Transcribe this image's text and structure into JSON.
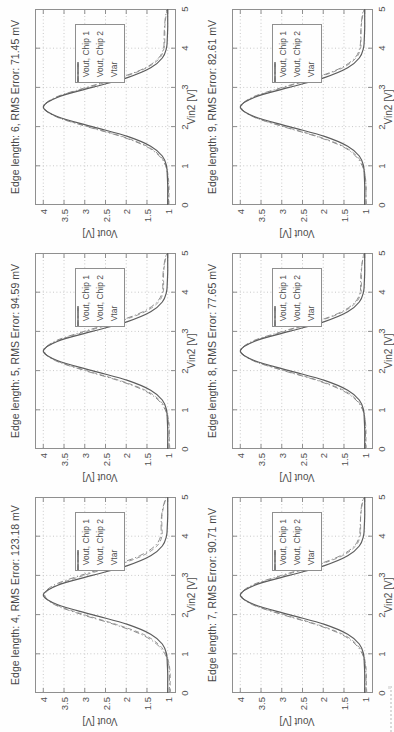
{
  "figure": {
    "xlabel": "Vin2 [V]",
    "ylabel": "Vout [V]",
    "xlim": [
      0,
      5
    ],
    "ylim": [
      0.8,
      4.2
    ],
    "xticks": [
      0,
      1,
      2,
      3,
      4,
      5
    ],
    "yticks": [
      4,
      3.5,
      3,
      2.5,
      2,
      1.5,
      1
    ],
    "xtick_labels": [
      "0",
      "1",
      "2",
      "3",
      "4",
      "5"
    ],
    "ytick_labels": [
      "4",
      "3.5",
      "3",
      "2.5",
      "2",
      "1.5",
      "1"
    ],
    "grid": "dotted",
    "legend": [
      "Vout, Chip 1",
      "Vout, Chip 2",
      "Vtar"
    ],
    "legend_position": "northeast",
    "colors": {
      "chip1": "#9b9b9b",
      "chip2": "#8d8d8d",
      "target": "#5c5c5c",
      "grid": "#c9c9c9",
      "frame": "#8f8f8f",
      "text": "#4a4a4a"
    }
  },
  "chart_data": [
    {
      "type": "line",
      "title": "Edge length: 4, RMS Error: 123.18 mV",
      "edge_length": 4,
      "rms_error_mV": 123.18,
      "xlabel": "Vin2 [V]",
      "ylabel": "Vout [V]",
      "xlim": [
        0,
        5
      ],
      "ylim": [
        0.8,
        4.2
      ],
      "x": [
        0,
        0.25,
        0.5,
        0.75,
        1,
        1.25,
        1.5,
        1.75,
        2,
        2.25,
        2.5,
        2.75,
        3,
        3.25,
        3.5,
        3.75,
        4,
        4.25,
        4.5,
        4.75,
        5
      ],
      "series": [
        {
          "name": "Vout, Chip 1",
          "style": "dashed",
          "values": [
            0.93,
            0.94,
            0.94,
            0.97,
            1.04,
            1.23,
            1.59,
            2.24,
            3.02,
            3.69,
            3.96,
            3.69,
            3.02,
            2.25,
            1.61,
            1.26,
            1.14,
            1.14,
            1.14,
            1.1,
            1.03
          ]
        },
        {
          "name": "Vout, Chip 2",
          "style": "dashdot",
          "values": [
            0.96,
            0.96,
            0.96,
            0.98,
            1.07,
            1.27,
            1.65,
            2.29,
            3.07,
            3.72,
            3.97,
            3.75,
            3.1,
            2.32,
            1.68,
            1.31,
            1.17,
            1.16,
            1.15,
            1.11,
            1.04
          ]
        },
        {
          "name": "Vtar",
          "style": "solid",
          "values": [
            1.0,
            1.0,
            1.0,
            1.01,
            1.03,
            1.13,
            1.41,
            1.97,
            2.82,
            3.65,
            4.0,
            3.65,
            2.82,
            1.97,
            1.41,
            1.13,
            1.03,
            1.01,
            1.0,
            1.0,
            1.0
          ]
        }
      ]
    },
    {
      "type": "line",
      "title": "Edge length: 5, RMS Error: 94.59 mV",
      "edge_length": 5,
      "rms_error_mV": 94.59,
      "xlabel": "Vin2 [V]",
      "ylabel": "Vout [V]",
      "xlim": [
        0,
        5
      ],
      "ylim": [
        0.8,
        4.2
      ],
      "x": [
        0,
        0.25,
        0.5,
        0.75,
        1,
        1.25,
        1.5,
        1.75,
        2,
        2.25,
        2.5,
        2.75,
        3,
        3.25,
        3.5,
        3.75,
        4,
        4.25,
        4.5,
        4.75,
        5
      ],
      "series": [
        {
          "name": "Vout, Chip 1",
          "style": "dashed",
          "values": [
            0.95,
            0.96,
            0.96,
            0.98,
            1.04,
            1.2,
            1.54,
            2.16,
            2.96,
            3.68,
            3.97,
            3.68,
            2.96,
            2.17,
            1.55,
            1.22,
            1.11,
            1.1,
            1.1,
            1.07,
            1.02
          ]
        },
        {
          "name": "Vout, Chip 2",
          "style": "dashdot",
          "values": [
            0.97,
            0.97,
            0.97,
            0.99,
            1.06,
            1.23,
            1.58,
            2.2,
            3.0,
            3.7,
            3.98,
            3.72,
            3.02,
            2.22,
            1.6,
            1.26,
            1.13,
            1.12,
            1.11,
            1.08,
            1.03
          ]
        },
        {
          "name": "Vtar",
          "style": "solid",
          "values": [
            1.0,
            1.0,
            1.0,
            1.01,
            1.03,
            1.13,
            1.41,
            1.97,
            2.82,
            3.65,
            4.0,
            3.65,
            2.82,
            1.97,
            1.41,
            1.13,
            1.03,
            1.01,
            1.0,
            1.0,
            1.0
          ]
        }
      ]
    },
    {
      "type": "line",
      "title": "Edge length: 6, RMS Error: 71.45 mV",
      "edge_length": 6,
      "rms_error_mV": 71.45,
      "xlabel": "Vin2 [V]",
      "ylabel": "Vout [V]",
      "xlim": [
        0,
        5
      ],
      "ylim": [
        0.8,
        4.2
      ],
      "x": [
        0,
        0.25,
        0.5,
        0.75,
        1,
        1.25,
        1.5,
        1.75,
        2,
        2.25,
        2.5,
        2.75,
        3,
        3.25,
        3.5,
        3.75,
        4,
        4.25,
        4.5,
        4.75,
        5
      ],
      "series": [
        {
          "name": "Vout, Chip 1",
          "style": "dashed",
          "values": [
            0.97,
            0.97,
            0.97,
            0.99,
            1.04,
            1.18,
            1.5,
            2.1,
            2.92,
            3.67,
            3.98,
            3.67,
            2.92,
            2.11,
            1.51,
            1.19,
            1.09,
            1.07,
            1.07,
            1.05,
            1.01
          ]
        },
        {
          "name": "Vout, Chip 2",
          "style": "dashdot",
          "values": [
            0.98,
            0.98,
            0.98,
            1.0,
            1.05,
            1.2,
            1.53,
            2.13,
            2.95,
            3.69,
            3.99,
            3.7,
            2.96,
            2.15,
            1.54,
            1.22,
            1.1,
            1.09,
            1.08,
            1.06,
            1.02
          ]
        },
        {
          "name": "Vtar",
          "style": "solid",
          "values": [
            1.0,
            1.0,
            1.0,
            1.01,
            1.03,
            1.13,
            1.41,
            1.97,
            2.82,
            3.65,
            4.0,
            3.65,
            2.82,
            1.97,
            1.41,
            1.13,
            1.03,
            1.01,
            1.0,
            1.0,
            1.0
          ]
        }
      ]
    },
    {
      "type": "line",
      "title": "Edge length: 7, RMS Error: 90.71 mV",
      "edge_length": 7,
      "rms_error_mV": 90.71,
      "xlabel": "Vin2 [V]",
      "ylabel": "Vout [V]",
      "xlim": [
        0,
        5
      ],
      "ylim": [
        0.8,
        4.2
      ],
      "x": [
        0,
        0.25,
        0.5,
        0.75,
        1,
        1.25,
        1.5,
        1.75,
        2,
        2.25,
        2.5,
        2.75,
        3,
        3.25,
        3.5,
        3.75,
        4,
        4.25,
        4.5,
        4.75,
        5
      ],
      "series": [
        {
          "name": "Vout, Chip 1",
          "style": "dashed",
          "values": [
            0.95,
            0.96,
            0.96,
            0.98,
            1.04,
            1.2,
            1.53,
            2.15,
            2.95,
            3.68,
            3.97,
            3.68,
            2.95,
            2.16,
            1.54,
            1.22,
            1.11,
            1.1,
            1.1,
            1.07,
            1.02
          ]
        },
        {
          "name": "Vout, Chip 2",
          "style": "dashdot",
          "values": [
            0.97,
            0.97,
            0.97,
            0.99,
            1.06,
            1.23,
            1.57,
            2.19,
            2.99,
            3.7,
            3.98,
            3.72,
            3.01,
            2.21,
            1.59,
            1.25,
            1.13,
            1.11,
            1.1,
            1.08,
            1.03
          ]
        },
        {
          "name": "Vtar",
          "style": "solid",
          "values": [
            1.0,
            1.0,
            1.0,
            1.01,
            1.03,
            1.13,
            1.41,
            1.97,
            2.82,
            3.65,
            4.0,
            3.65,
            2.82,
            1.97,
            1.41,
            1.13,
            1.03,
            1.01,
            1.0,
            1.0,
            1.0
          ]
        }
      ]
    },
    {
      "type": "line",
      "title": "Edge length: 8, RMS Error: 77.65 mV",
      "edge_length": 8,
      "rms_error_mV": 77.65,
      "xlabel": "Vin2 [V]",
      "ylabel": "Vout [V]",
      "xlim": [
        0,
        5
      ],
      "ylim": [
        0.8,
        4.2
      ],
      "x": [
        0,
        0.25,
        0.5,
        0.75,
        1,
        1.25,
        1.5,
        1.75,
        2,
        2.25,
        2.5,
        2.75,
        3,
        3.25,
        3.5,
        3.75,
        4,
        4.25,
        4.5,
        4.75,
        5
      ],
      "series": [
        {
          "name": "Vout, Chip 1",
          "style": "dashed",
          "values": [
            0.96,
            0.97,
            0.97,
            0.99,
            1.04,
            1.19,
            1.51,
            2.12,
            2.93,
            3.67,
            3.98,
            3.67,
            2.93,
            2.13,
            1.52,
            1.2,
            1.09,
            1.08,
            1.08,
            1.06,
            1.02
          ]
        },
        {
          "name": "Vout, Chip 2",
          "style": "dashdot",
          "values": [
            0.98,
            0.98,
            0.98,
            0.99,
            1.05,
            1.21,
            1.55,
            2.15,
            2.96,
            3.69,
            3.98,
            3.71,
            2.98,
            2.17,
            1.56,
            1.23,
            1.11,
            1.1,
            1.09,
            1.06,
            1.02
          ]
        },
        {
          "name": "Vtar",
          "style": "solid",
          "values": [
            1.0,
            1.0,
            1.0,
            1.01,
            1.03,
            1.13,
            1.41,
            1.97,
            2.82,
            3.65,
            4.0,
            3.65,
            2.82,
            1.97,
            1.41,
            1.13,
            1.03,
            1.01,
            1.0,
            1.0,
            1.0
          ]
        }
      ]
    },
    {
      "type": "line",
      "title": "Edge length: 9, RMS Error: 82.61 mV",
      "edge_length": 9,
      "rms_error_mV": 82.61,
      "xlabel": "Vin2 [V]",
      "ylabel": "Vout [V]",
      "xlim": [
        0,
        5
      ],
      "ylim": [
        0.8,
        4.2
      ],
      "x": [
        0,
        0.25,
        0.5,
        0.75,
        1,
        1.25,
        1.5,
        1.75,
        2,
        2.25,
        2.5,
        2.75,
        3,
        3.25,
        3.5,
        3.75,
        4,
        4.25,
        4.5,
        4.75,
        5
      ],
      "series": [
        {
          "name": "Vout, Chip 1",
          "style": "dashed",
          "values": [
            0.96,
            0.97,
            0.97,
            0.99,
            1.04,
            1.19,
            1.52,
            2.13,
            2.94,
            3.68,
            3.97,
            3.68,
            2.94,
            2.14,
            1.53,
            1.21,
            1.1,
            1.09,
            1.09,
            1.06,
            1.02
          ]
        },
        {
          "name": "Vout, Chip 2",
          "style": "dashdot",
          "values": [
            0.97,
            0.97,
            0.97,
            0.99,
            1.06,
            1.22,
            1.55,
            2.17,
            2.97,
            3.69,
            3.98,
            3.71,
            2.99,
            2.18,
            1.57,
            1.24,
            1.12,
            1.1,
            1.09,
            1.07,
            1.03
          ]
        },
        {
          "name": "Vtar",
          "style": "solid",
          "values": [
            1.0,
            1.0,
            1.0,
            1.01,
            1.03,
            1.13,
            1.41,
            1.97,
            2.82,
            3.65,
            4.0,
            3.65,
            2.82,
            1.97,
            1.41,
            1.13,
            1.03,
            1.01,
            1.0,
            1.0,
            1.0
          ]
        }
      ]
    }
  ]
}
